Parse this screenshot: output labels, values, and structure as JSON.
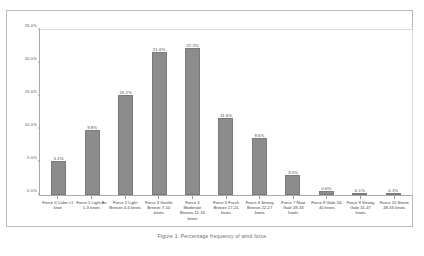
{
  "chart_data": {
    "type": "bar",
    "title": "",
    "xlabel": "",
    "ylabel": "",
    "ylim": [
      0,
      25
    ],
    "grid": false,
    "legend": "none",
    "categories": [
      "Force 0 Calm <1 knot",
      "Force 1 Light Air 1-3 knots",
      "Force 2 Light Breeze 4-6 knots",
      "Force 3 Gentle Breeze 7-10 knots",
      "Force 4 Moderate Breeze 11-16 knots",
      "Force 5 Fresh Breeze 17-21 knots",
      "Force 6 Strong Breeze 22-27 knots",
      "Force 7 Near Gale 28-33 knots",
      "Force 8 Gale 34-40 knots",
      "Force 9 Strong Gale 41-47 knots",
      "Force 10 Storm 48-55 knots"
    ],
    "values": [
      5.1,
      9.8,
      15.2,
      21.6,
      22.2,
      11.6,
      8.6,
      3.0,
      0.6,
      0.1,
      0.1
    ],
    "value_labels": [
      "5.1%",
      "9.8%",
      "15.2%",
      "21.6%",
      "22.2%",
      "11.6%",
      "8.6%",
      "3.0%",
      "0.6%",
      "0.1%",
      "0.1%"
    ],
    "y_ticks": [
      {
        "value": 25,
        "label": "25.0%"
      },
      {
        "value": 20,
        "label": "20.0%"
      },
      {
        "value": 15,
        "label": "15.0%"
      },
      {
        "value": 10,
        "label": "10.0%"
      },
      {
        "value": 5,
        "label": "5.0%"
      },
      {
        "value": 0,
        "label": "0.0%"
      }
    ],
    "bar_color": "#8c8c8c",
    "axis_color": "#a8a8a8"
  },
  "caption": {
    "text": "Figure 1: Percentage frequency of wind force"
  }
}
